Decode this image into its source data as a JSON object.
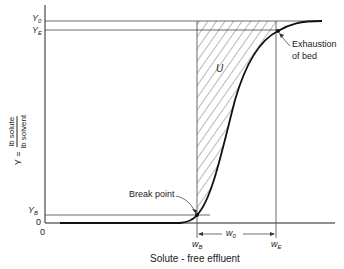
{
  "diagram": {
    "type": "breakthrough-curve",
    "y_axis": {
      "label_prefix": "Y =",
      "label_numerator": "lb solute",
      "label_denominator": "lb solvent"
    },
    "x_axis": {
      "label": "Solute - free effluent"
    },
    "ticks": {
      "y0": {
        "main": "Y",
        "sub": "0"
      },
      "ye": {
        "main": "Y",
        "sub": "E"
      },
      "yb": {
        "main": "Y",
        "sub": "B"
      },
      "zero_y": "0",
      "zero_x": "0",
      "wb": {
        "main": "w",
        "sub": "B"
      },
      "wo": {
        "main": "w",
        "sub": "0"
      },
      "we": {
        "main": "w",
        "sub": "E"
      }
    },
    "annotations": {
      "area": "U",
      "break_point": "Break point",
      "exhaustion_line1": "Exhaustion",
      "exhaustion_line2": "of bed"
    },
    "colors": {
      "ink": "#222222",
      "background": "#ffffff"
    }
  }
}
